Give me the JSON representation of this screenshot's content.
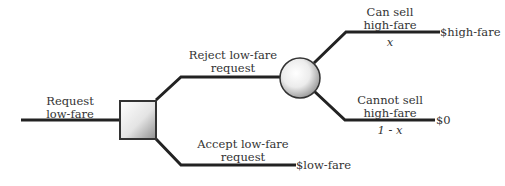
{
  "diagram": {
    "type": "decision-tree",
    "nodes": {
      "decision": {
        "shape": "square",
        "label": "decision node"
      },
      "chance": {
        "shape": "circle",
        "label": "chance node"
      }
    },
    "branches": {
      "request": {
        "line1": "Request",
        "line2": "low-fare"
      },
      "reject": {
        "line1": "Reject low-fare",
        "line2": "request"
      },
      "accept": {
        "line1": "Accept low-fare",
        "line2": "request"
      },
      "can_sell": {
        "line1": "Can sell",
        "line2": "high-fare",
        "probability": "x"
      },
      "cannot_sell": {
        "line1": "Cannot sell",
        "line2": "high-fare",
        "probability": "1 - x"
      }
    },
    "outcomes": {
      "high": "$high-fare",
      "zero": "$0",
      "low": "$low-fare"
    },
    "colors": {
      "line": "#222222",
      "node_fill_light": "#ffffff",
      "node_fill_dark": "#9a9a9a"
    }
  }
}
